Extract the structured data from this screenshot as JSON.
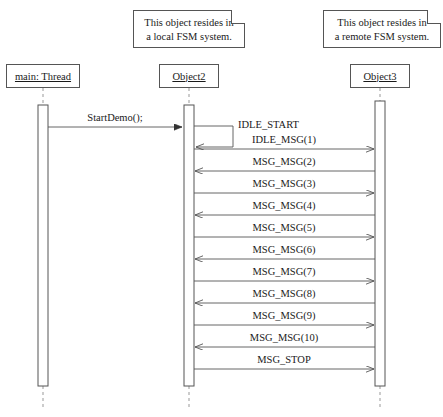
{
  "diagram": {
    "width": 443,
    "height": 417,
    "line_color": "#555555",
    "dash_color": "#999999",
    "text_color": "#1a1a1a",
    "background": "#ffffff"
  },
  "notes": [
    {
      "id": "note-local",
      "line1": "This object resides in",
      "line2": "a local FSM system.",
      "attached_to": "Object2"
    },
    {
      "id": "note-remote",
      "line1": "This object resides in",
      "line2": "a remote FSM system.",
      "attached_to": "Object3"
    }
  ],
  "lifelines": [
    {
      "id": "main-thread",
      "label": "main: Thread",
      "x": 43
    },
    {
      "id": "object2",
      "label": "Object2",
      "x": 189
    },
    {
      "id": "object3",
      "label": "Object3",
      "x": 380
    }
  ],
  "messages": [
    {
      "id": "msg-startdemo",
      "label": "StartDemo();",
      "from": "main-thread",
      "to": "object2",
      "direction": "right",
      "y": 127
    },
    {
      "id": "msg-idle-start",
      "label": "IDLE_START",
      "from": "object2",
      "to": "object2",
      "direction": "self",
      "y": 127
    },
    {
      "id": "msg-1",
      "label": "IDLE_MSG(1)",
      "from": "object2",
      "to": "object3",
      "direction": "right",
      "y": 149
    },
    {
      "id": "msg-2",
      "label": "MSG_MSG(2)",
      "from": "object3",
      "to": "object2",
      "direction": "left",
      "y": 171
    },
    {
      "id": "msg-3",
      "label": "MSG_MSG(3)",
      "from": "object2",
      "to": "object3",
      "direction": "right",
      "y": 193
    },
    {
      "id": "msg-4",
      "label": "MSG_MSG(4)",
      "from": "object3",
      "to": "object2",
      "direction": "left",
      "y": 215
    },
    {
      "id": "msg-5",
      "label": "MSG_MSG(5)",
      "from": "object2",
      "to": "object3",
      "direction": "right",
      "y": 237
    },
    {
      "id": "msg-6",
      "label": "MSG_MSG(6)",
      "from": "object3",
      "to": "object2",
      "direction": "left",
      "y": 259
    },
    {
      "id": "msg-7",
      "label": "MSG_MSG(7)",
      "from": "object2",
      "to": "object3",
      "direction": "right",
      "y": 281
    },
    {
      "id": "msg-8",
      "label": "MSG_MSG(8)",
      "from": "object3",
      "to": "object2",
      "direction": "left",
      "y": 303
    },
    {
      "id": "msg-9",
      "label": "MSG_MSG(9)",
      "from": "object2",
      "to": "object3",
      "direction": "right",
      "y": 325
    },
    {
      "id": "msg-10",
      "label": "MSG_MSG(10)",
      "from": "object3",
      "to": "object2",
      "direction": "left",
      "y": 347
    },
    {
      "id": "msg-stop",
      "label": "MSG_STOP",
      "from": "object2",
      "to": "object3",
      "direction": "right",
      "y": 369
    }
  ]
}
